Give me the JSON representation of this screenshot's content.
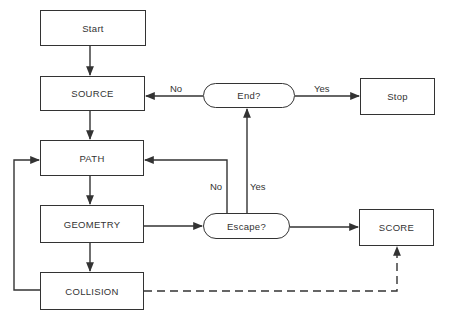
{
  "nodes": {
    "start": "Start",
    "source": "SOURCE",
    "path": "PATH",
    "geometry": "GEOMETRY",
    "collision": "COLLISION",
    "end": "End?",
    "stop": "Stop",
    "escape": "Escape?",
    "score": "SCORE"
  },
  "edge_labels": {
    "end_no": "No",
    "end_yes": "Yes",
    "escape_no": "No",
    "escape_yes": "Yes"
  },
  "colors": {
    "stroke": "#333333",
    "background": "#ffffff"
  }
}
